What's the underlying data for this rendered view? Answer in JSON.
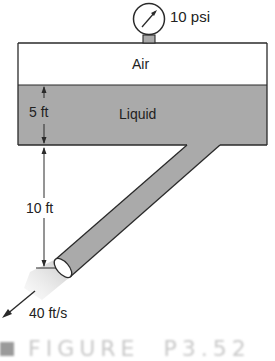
{
  "figure": {
    "gauge_label": "10 psi",
    "air_label": "Air",
    "liquid_label": "Liquid",
    "liquid_depth_label": "5 ft",
    "pipe_drop_label": "10 ft",
    "exit_velocity_label": "40 ft/s",
    "caption_label": "FIGURE",
    "caption_number": "P3.52"
  },
  "colors": {
    "liquid_fill": "#aaaaaa",
    "air_fill": "#ffffff",
    "outline": "#2a2a2a",
    "jet_fill": "#d6d6d6",
    "caption_gray": "#c8c8c8"
  }
}
